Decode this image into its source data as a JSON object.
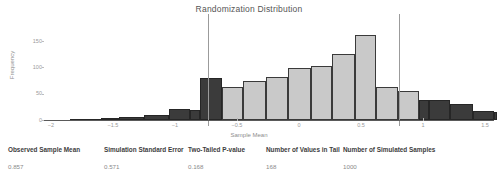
{
  "chart_data": {
    "type": "bar",
    "title": "Randomization Distribution",
    "xlabel": "Sample Mean",
    "ylabel": "Frequency",
    "xlim": [
      -2.1,
      1.6
    ],
    "ylim": [
      0,
      168
    ],
    "grid": false,
    "legend": "none",
    "bin_width": 0.25,
    "x_ticks": [
      -2,
      -1.5,
      -1,
      -0.5,
      0,
      0.5,
      1,
      1.5
    ],
    "x_tick_labels": [
      "−2",
      "−1.5",
      "−1",
      "−0.5",
      "0",
      "0.5",
      "1",
      "1.5"
    ],
    "y_ticks": [
      0,
      50,
      100,
      150
    ],
    "y_tick_labels": [
      "0",
      "50",
      "100",
      "150"
    ],
    "bins": [
      {
        "left": -1.85,
        "right": -1.6,
        "value": 2,
        "tail": true
      },
      {
        "left": -1.6,
        "right": -1.45,
        "value": 4,
        "tail": true
      },
      {
        "left": -1.45,
        "right": -1.25,
        "value": 5,
        "tail": true
      },
      {
        "left": -1.25,
        "right": -1.05,
        "value": 9,
        "tail": true
      },
      {
        "left": -1.05,
        "right": -0.88,
        "value": 20,
        "tail": true
      },
      {
        "left": -0.88,
        "right": -0.8,
        "value": 19,
        "tail": true
      },
      {
        "left": -0.8,
        "right": -0.62,
        "value": 79,
        "tail": true
      },
      {
        "left": -0.62,
        "right": -0.45,
        "value": 62,
        "tail": false
      },
      {
        "left": -0.45,
        "right": -0.27,
        "value": 74,
        "tail": false
      },
      {
        "left": -0.27,
        "right": -0.09,
        "value": 82,
        "tail": false
      },
      {
        "left": -0.09,
        "right": 0.1,
        "value": 98,
        "tail": false
      },
      {
        "left": 0.1,
        "right": 0.27,
        "value": 103,
        "tail": false
      },
      {
        "left": 0.27,
        "right": 0.45,
        "value": 126,
        "tail": false
      },
      {
        "left": 0.45,
        "right": 0.62,
        "value": 162,
        "tail": false
      },
      {
        "left": 0.62,
        "right": 0.8,
        "value": 62,
        "tail": false
      },
      {
        "left": 0.8,
        "right": 0.97,
        "value": 55,
        "tail": false
      },
      {
        "left": 0.97,
        "right": 1.05,
        "value": 38,
        "tail": true
      },
      {
        "left": 1.05,
        "right": 1.22,
        "value": 38,
        "tail": true
      },
      {
        "left": 1.22,
        "right": 1.4,
        "value": 30,
        "tail": true
      },
      {
        "left": 1.4,
        "right": 1.57,
        "value": 18,
        "tail": true
      },
      {
        "left": 1.57,
        "right": 1.6,
        "value": 16,
        "tail": true
      }
    ],
    "reference_lines": [
      {
        "name": "lower-bound",
        "x": -0.73
      },
      {
        "name": "upper-bound",
        "x": 0.81
      }
    ],
    "colors": {
      "inside_bar": "#c9c9c9",
      "tail_bar": "#3b3b3b",
      "bar_border": "#3a3a3a",
      "reference_line": "#9b9b9b",
      "axis": "#5a5a5a"
    }
  },
  "stats": {
    "columns": [
      {
        "header": "Observed Sample Mean",
        "value": "0.857"
      },
      {
        "header": "Simulation Standard Error",
        "value": "0.571"
      },
      {
        "header": "Two-Tailed P-value",
        "value": "0.168"
      },
      {
        "header": "Number of Values in Tail",
        "value": "168"
      },
      {
        "header": "Number of Simulated Samples",
        "value": "1000"
      }
    ]
  }
}
